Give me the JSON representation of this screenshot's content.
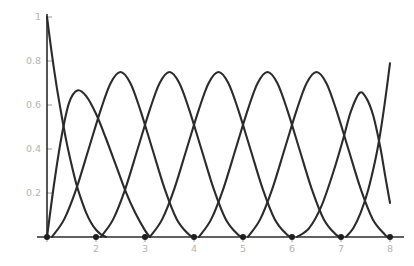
{
  "chart_data": {
    "type": "line",
    "title": "",
    "subtitle": "",
    "xlabel": "",
    "ylabel": "",
    "xlim": [
      1,
      8
    ],
    "ylim": [
      0,
      1
    ],
    "grid": false,
    "legend": false,
    "legend_position": "none",
    "background": "#ffffff",
    "curve_color": "#2b2b2b",
    "axis_color": "#2b2b2b",
    "tick_label_color": "#b3b3b3",
    "knot_color": "#1e1e1e",
    "xticks": [
      2,
      3,
      4,
      5,
      6,
      7,
      8
    ],
    "xtick_labels": [
      "2",
      "3",
      "4",
      "5",
      "6",
      "7",
      "8"
    ],
    "yticks": [
      0.2,
      0.4,
      0.6,
      0.8,
      1
    ],
    "ytick_labels": [
      "0.2",
      "0.4",
      "0.6",
      "0.8",
      "1"
    ],
    "knots": [
      1,
      2,
      3,
      4,
      5,
      6,
      7,
      8
    ],
    "annotations": [],
    "series": [
      {
        "name": "B-spline basis 1",
        "peak_x": 1.0,
        "peak_y": 1.0,
        "support": [
          1,
          2.2
        ],
        "points": [
          [
            1.0,
            1.0
          ],
          [
            1.1,
            0.83
          ],
          [
            1.2,
            0.68
          ],
          [
            1.3,
            0.55
          ],
          [
            1.4,
            0.43
          ],
          [
            1.5,
            0.33
          ],
          [
            1.6,
            0.24
          ],
          [
            1.7,
            0.17
          ],
          [
            1.8,
            0.11
          ],
          [
            1.9,
            0.065
          ],
          [
            2.0,
            0.033
          ],
          [
            2.1,
            0.012
          ],
          [
            2.2,
            0.0
          ]
        ]
      },
      {
        "name": "B-spline basis 2",
        "peak_x": 1.62,
        "peak_y": 0.666,
        "support": [
          1,
          3.1
        ],
        "points": [
          [
            1.0,
            0.0
          ],
          [
            1.15,
            0.25
          ],
          [
            1.3,
            0.46
          ],
          [
            1.45,
            0.61
          ],
          [
            1.62,
            0.666
          ],
          [
            1.8,
            0.64
          ],
          [
            2.0,
            0.56
          ],
          [
            2.2,
            0.45
          ],
          [
            2.4,
            0.33
          ],
          [
            2.6,
            0.21
          ],
          [
            2.8,
            0.11
          ],
          [
            3.0,
            0.03
          ],
          [
            3.1,
            0.0
          ]
        ]
      },
      {
        "name": "B-spline basis 3",
        "peak_x": 2.5,
        "peak_y": 0.75,
        "support": [
          1.1,
          4.0
        ],
        "points": [
          [
            1.1,
            0.0
          ],
          [
            1.35,
            0.08
          ],
          [
            1.6,
            0.22
          ],
          [
            1.85,
            0.4
          ],
          [
            2.1,
            0.58
          ],
          [
            2.3,
            0.7
          ],
          [
            2.5,
            0.75
          ],
          [
            2.7,
            0.7
          ],
          [
            2.9,
            0.58
          ],
          [
            3.15,
            0.4
          ],
          [
            3.4,
            0.22
          ],
          [
            3.65,
            0.08
          ],
          [
            3.9,
            0.01
          ],
          [
            4.0,
            0.0
          ]
        ]
      },
      {
        "name": "B-spline basis 4",
        "peak_x": 3.5,
        "peak_y": 0.75,
        "support": [
          2.1,
          5.0
        ],
        "points": [
          [
            2.1,
            0.0
          ],
          [
            2.35,
            0.08
          ],
          [
            2.6,
            0.22
          ],
          [
            2.85,
            0.4
          ],
          [
            3.1,
            0.58
          ],
          [
            3.3,
            0.7
          ],
          [
            3.5,
            0.75
          ],
          [
            3.7,
            0.7
          ],
          [
            3.9,
            0.58
          ],
          [
            4.15,
            0.4
          ],
          [
            4.4,
            0.22
          ],
          [
            4.65,
            0.08
          ],
          [
            4.9,
            0.01
          ],
          [
            5.0,
            0.0
          ]
        ]
      },
      {
        "name": "B-spline basis 5",
        "peak_x": 4.5,
        "peak_y": 0.75,
        "support": [
          3.1,
          6.0
        ],
        "points": [
          [
            3.1,
            0.0
          ],
          [
            3.35,
            0.08
          ],
          [
            3.6,
            0.22
          ],
          [
            3.85,
            0.4
          ],
          [
            4.1,
            0.58
          ],
          [
            4.3,
            0.7
          ],
          [
            4.5,
            0.75
          ],
          [
            4.7,
            0.7
          ],
          [
            4.9,
            0.58
          ],
          [
            5.15,
            0.4
          ],
          [
            5.4,
            0.22
          ],
          [
            5.65,
            0.08
          ],
          [
            5.9,
            0.01
          ],
          [
            6.0,
            0.0
          ]
        ]
      },
      {
        "name": "B-spline basis 6",
        "peak_x": 5.5,
        "peak_y": 0.75,
        "support": [
          4.1,
          7.0
        ],
        "points": [
          [
            4.1,
            0.0
          ],
          [
            4.35,
            0.08
          ],
          [
            4.6,
            0.22
          ],
          [
            4.85,
            0.4
          ],
          [
            5.1,
            0.58
          ],
          [
            5.3,
            0.7
          ],
          [
            5.5,
            0.75
          ],
          [
            5.7,
            0.7
          ],
          [
            5.9,
            0.58
          ],
          [
            6.15,
            0.4
          ],
          [
            6.4,
            0.22
          ],
          [
            6.65,
            0.08
          ],
          [
            6.9,
            0.01
          ],
          [
            7.0,
            0.0
          ]
        ]
      },
      {
        "name": "B-spline basis 7",
        "peak_x": 6.5,
        "peak_y": 0.75,
        "support": [
          5.1,
          7.95
        ],
        "points": [
          [
            5.1,
            0.0
          ],
          [
            5.35,
            0.08
          ],
          [
            5.6,
            0.22
          ],
          [
            5.85,
            0.4
          ],
          [
            6.1,
            0.58
          ],
          [
            6.3,
            0.7
          ],
          [
            6.5,
            0.75
          ],
          [
            6.7,
            0.7
          ],
          [
            6.9,
            0.58
          ],
          [
            7.15,
            0.4
          ],
          [
            7.4,
            0.22
          ],
          [
            7.65,
            0.08
          ],
          [
            7.9,
            0.01
          ],
          [
            7.95,
            0.0
          ]
        ]
      },
      {
        "name": "B-spline basis 8",
        "peak_x": 7.38,
        "peak_y": 0.655,
        "support": [
          6.1,
          8.0
        ],
        "points": [
          [
            6.1,
            0.0
          ],
          [
            6.35,
            0.04
          ],
          [
            6.6,
            0.14
          ],
          [
            6.85,
            0.3
          ],
          [
            7.05,
            0.45
          ],
          [
            7.2,
            0.57
          ],
          [
            7.38,
            0.655
          ],
          [
            7.52,
            0.63
          ],
          [
            7.66,
            0.55
          ],
          [
            7.8,
            0.41
          ],
          [
            7.9,
            0.28
          ],
          [
            8.0,
            0.155
          ]
        ]
      },
      {
        "name": "B-spline basis 9",
        "peak_x": 8.0,
        "peak_y": 0.79,
        "support": [
          7.1,
          8.0
        ],
        "points": [
          [
            7.1,
            0.0
          ],
          [
            7.25,
            0.04
          ],
          [
            7.4,
            0.11
          ],
          [
            7.55,
            0.21
          ],
          [
            7.7,
            0.35
          ],
          [
            7.8,
            0.47
          ],
          [
            7.9,
            0.62
          ],
          [
            8.0,
            0.79
          ]
        ]
      }
    ]
  }
}
